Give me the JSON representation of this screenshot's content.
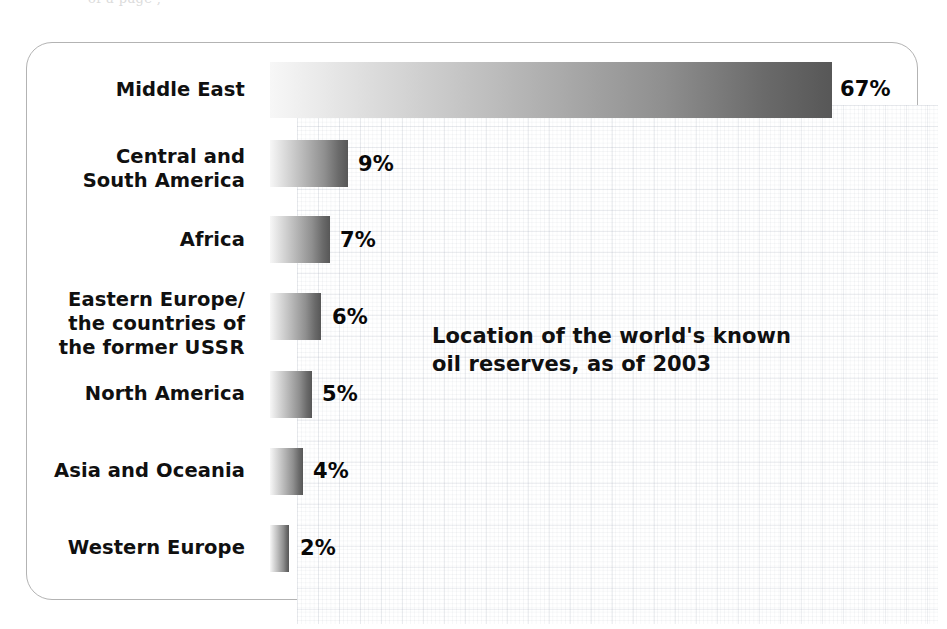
{
  "top_bleed_text": "of  a  page  ,",
  "figure": {
    "annotation": "Location of the world's known\noil reserves, as of 2003",
    "value_suffix": "%"
  },
  "chart_data": {
    "type": "bar",
    "orientation": "horizontal",
    "title": "Location of the world's known oil reserves, as of 2003",
    "xlabel": "",
    "ylabel": "",
    "xlim": [
      0,
      70
    ],
    "grid": true,
    "legend": "none",
    "unit": "%",
    "categories": [
      "Middle East",
      "Central and\nSouth America",
      "Africa",
      "Eastern Europe/\nthe countries of\nthe former USSR",
      "North America",
      "Asia and Oceania",
      "Western Europe"
    ],
    "values": [
      67,
      9,
      7,
      6,
      5,
      4,
      2
    ],
    "value_labels": [
      "67%",
      "9%",
      "7%",
      "6%",
      "5%",
      "4%",
      "2%"
    ]
  },
  "rows": [
    {
      "label_html": "Middle East",
      "label": "Middle East",
      "value_label": "67%",
      "bar_top": 62,
      "bar_height": 56,
      "bar_width": 562,
      "label_top": 78,
      "value_left": 840,
      "value_top": 77
    },
    {
      "label_html": "Central and\nSouth America",
      "label": "Central and South America",
      "value_label": "9%",
      "bar_top": 140,
      "bar_height": 47,
      "bar_width": 78,
      "label_top": 145,
      "value_left": 358,
      "value_top": 152
    },
    {
      "label_html": "Africa",
      "label": "Africa",
      "value_label": "7%",
      "bar_top": 216,
      "bar_height": 47,
      "bar_width": 60,
      "label_top": 228,
      "value_left": 340,
      "value_top": 228
    },
    {
      "label_html": "Eastern Europe/\nthe countries of\nthe former <b>USSR</b>",
      "label": "Eastern Europe/ the countries of the former USSR",
      "value_label": "6%",
      "bar_top": 293,
      "bar_height": 47,
      "bar_width": 51,
      "label_top": 288,
      "value_left": 332,
      "value_top": 305
    },
    {
      "label_html": "North America",
      "label": "North America",
      "value_label": "5%",
      "bar_top": 371,
      "bar_height": 47,
      "bar_width": 42,
      "label_top": 382,
      "value_left": 322,
      "value_top": 382
    },
    {
      "label_html": "Asia and Oceania",
      "label": "Asia and Oceania",
      "value_label": "4%",
      "bar_top": 448,
      "bar_height": 47,
      "bar_width": 33,
      "label_top": 459,
      "value_left": 313,
      "value_top": 459
    },
    {
      "label_html": "Western Europe",
      "label": "Western Europe",
      "value_label": "2%",
      "bar_top": 525,
      "bar_height": 47,
      "bar_width": 19,
      "label_top": 536,
      "value_left": 300,
      "value_top": 536
    }
  ],
  "colors": {
    "frame_border": "#b3b3b3",
    "bar_gradient_start": "#f7f7f7",
    "bar_gradient_end": "#575757",
    "text": "#101010",
    "grid_line": "#96a0af",
    "background": "#ffffff"
  }
}
